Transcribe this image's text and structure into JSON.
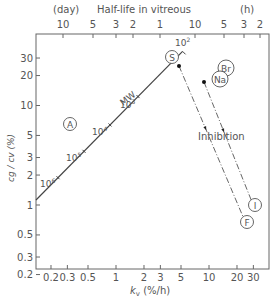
{
  "chart_data": {
    "type": "scatter",
    "title": "",
    "top_axis": {
      "title": "Half-life in vitreous",
      "unit_left": "(day)",
      "unit_right": "(h)",
      "ticks": [
        {
          "label": "10",
          "x": 63
        },
        {
          "label": "5",
          "x": 93
        },
        {
          "label": "3",
          "x": 116
        },
        {
          "label": "2",
          "x": 133
        },
        {
          "label": "1",
          "x": 160
        },
        {
          "label": "10",
          "x": 195
        },
        {
          "label": "5",
          "x": 224
        },
        {
          "label": "3",
          "x": 244
        },
        {
          "label": "2",
          "x": 260
        }
      ]
    },
    "xlabel": "k_v (%/h)",
    "xlabel_main": "k",
    "xlabel_sub": "v",
    "xlabel_unit": " (%/h)",
    "xscale": "log",
    "xlim": [
      0.15,
      40
    ],
    "xticks": [
      {
        "label": "0.2",
        "v": 0.2
      },
      {
        "label": "0.3",
        "v": 0.3
      },
      {
        "label": "0.5",
        "v": 0.5
      },
      {
        "label": "1",
        "v": 1
      },
      {
        "label": "2",
        "v": 2
      },
      {
        "label": "3",
        "v": 3
      },
      {
        "label": "5",
        "v": 5
      },
      {
        "label": "10",
        "v": 10
      },
      {
        "label": "20",
        "v": 20
      },
      {
        "label": "30",
        "v": 30
      }
    ],
    "ylabel": "c_g / c_v (%)",
    "ylabel_text": "cg / cv (%)",
    "yscale": "log",
    "ylim": [
      0.2,
      50
    ],
    "yticks": [
      {
        "label": "30",
        "v": 30
      },
      {
        "label": "20",
        "v": 20
      },
      {
        "label": "10",
        "v": 10
      },
      {
        "label": "5",
        "v": 5
      },
      {
        "label": "3",
        "v": 3
      },
      {
        "label": "2",
        "v": 2
      },
      {
        "label": "1",
        "v": 1
      },
      {
        "label": "0.5",
        "v": 0.5
      },
      {
        "label": "0.3",
        "v": 0.3
      },
      {
        "label": "0.2",
        "v": 0.2
      }
    ],
    "mw_line": {
      "label": "MW",
      "from": {
        "kv": 0.15,
        "ratio": 1.15
      },
      "to": {
        "kv": 5.2,
        "ratio": 35
      },
      "markers": [
        {
          "label": "10^6",
          "base": "10",
          "exp": "6",
          "kv": 0.3,
          "ratio": 2.0
        },
        {
          "label": "10^5",
          "base": "10",
          "exp": "5",
          "kv": 0.7,
          "ratio": 4.5
        },
        {
          "label": "10^4",
          "base": "10",
          "exp": "4",
          "kv": 1.4,
          "ratio": 9.0
        },
        {
          "label": "10^3",
          "base": "10",
          "exp": "3",
          "kv": 3.0,
          "ratio": 19
        },
        {
          "label": "10^2",
          "base": "10",
          "exp": "2",
          "kv": 5.2,
          "ratio": 35
        }
      ]
    },
    "points": [
      {
        "label": "A",
        "kv": 0.62,
        "ratio": 6.2,
        "type": "circle-label"
      },
      {
        "label": "S",
        "kv": 3.9,
        "ratio": 33,
        "type": "circle-label"
      },
      {
        "label": "Br",
        "kv": 13,
        "ratio": 17,
        "type": "circle-label"
      },
      {
        "label": "Na",
        "kv": 12,
        "ratio": 14,
        "type": "circle-label"
      },
      {
        "label": "I",
        "kv": 27,
        "ratio": 1.0,
        "type": "circle-label"
      },
      {
        "label": "F",
        "kv": 22,
        "ratio": 0.7,
        "type": "circle-label"
      }
    ],
    "inhibition": {
      "label": "Inhibition",
      "arrows": [
        {
          "from": {
            "kv": 4.4,
            "ratio": 24
          },
          "to": {
            "kv": 22,
            "ratio": 0.7
          }
        },
        {
          "from": {
            "kv": 8.5,
            "ratio": 17
          },
          "to": {
            "kv": 27,
            "ratio": 1.0
          }
        }
      ]
    },
    "grid": false,
    "legend": "none"
  }
}
